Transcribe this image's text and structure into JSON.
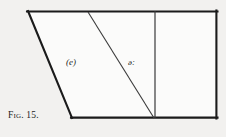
{
  "figure": {
    "caption_prefix": "Fig.",
    "caption_number": "15.",
    "caption_full": "Fig. 15."
  },
  "labels": {
    "front_region": "(e)",
    "central_region": "ə:"
  },
  "colors": {
    "background": "#f2f1ef",
    "stroke_heavy": "#1b1b1b",
    "stroke_light": "#3a3a3a",
    "text": "#1b1b1b",
    "fill": "#fbfbfa"
  },
  "geometry": {
    "outer_shape": "trapezoid",
    "top_left": [
      28,
      11
    ],
    "top_right": [
      217,
      11
    ],
    "bottom_right": [
      217,
      118
    ],
    "bottom_left": [
      72,
      118
    ],
    "interior_slant_top": [
      88,
      12
    ],
    "interior_slant_bottom": [
      154,
      118
    ],
    "vertical_divider_x": 155,
    "vertical_divider_top": 11,
    "vertical_divider_bottom": 118
  }
}
